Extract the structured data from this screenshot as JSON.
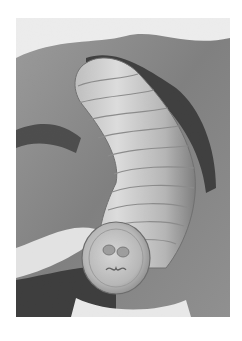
{
  "image": {
    "alt": "Grayscale scanning electron micrograph of a segmented larva emerging from a textured surface",
    "style": "grayscale",
    "background": "#ffffff",
    "subject": "segmented larva",
    "colors": {
      "substrate_dark": "#3a3a3a",
      "substrate_mid": "#8c8c8c",
      "substrate_light": "#e6e6e6",
      "body_light": "#d8d8d8",
      "body_shadow": "#7a7a7a"
    }
  }
}
